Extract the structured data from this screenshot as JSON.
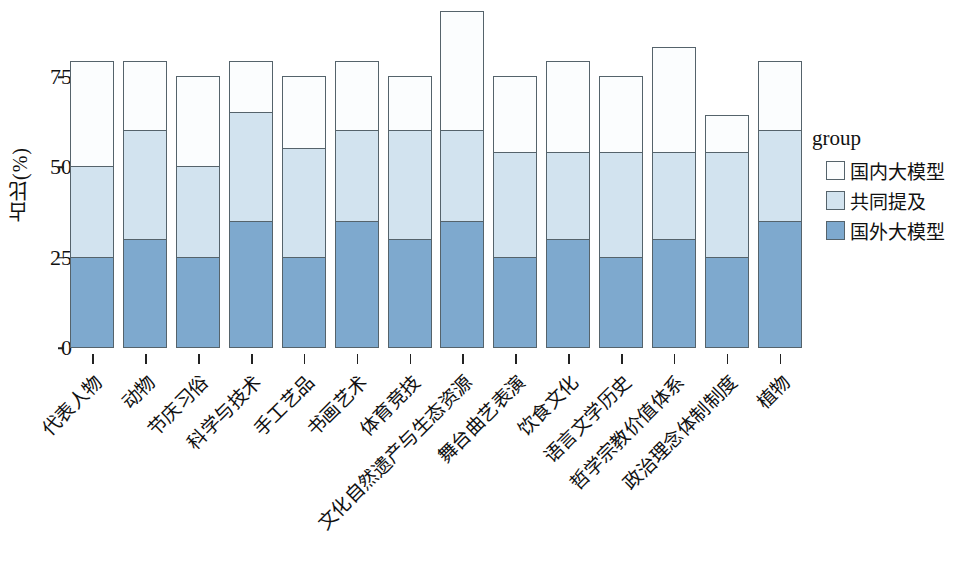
{
  "chart_data": {
    "type": "bar",
    "subtype": "stacked-bar",
    "title": "",
    "xlabel": "",
    "ylabel": "占比(%)",
    "ylim": [
      0,
      100
    ],
    "yticks": [
      0,
      25,
      50,
      75
    ],
    "ytick_labels": [
      "0",
      "25",
      "50",
      "75"
    ],
    "grid": false,
    "legend_position": "right",
    "legend_title": "group",
    "categories": [
      "代表人物",
      "动物",
      "节庆习俗",
      "科学与技术",
      "手工艺品",
      "书画艺术",
      "体育竞技",
      "文化自然遗产与生态资源",
      "舞台曲艺表演",
      "饮食文化",
      "语言文学历史",
      "哲学宗教价值体系",
      "政治理念体制制度",
      "植物"
    ],
    "series": [
      {
        "name": "国外大模型",
        "color": "#7ea9ce",
        "values": [
          25,
          30,
          25,
          35,
          25,
          35,
          30,
          35,
          25,
          30,
          25,
          30,
          25,
          35
        ]
      },
      {
        "name": "共同提及",
        "color": "#d2e3ef",
        "values": [
          25,
          30,
          25,
          30,
          30,
          25,
          30,
          25,
          29,
          24,
          29,
          24,
          29,
          25
        ]
      },
      {
        "name": "国内大模型",
        "color": "#fbfdfe",
        "values": [
          29,
          19,
          25,
          14,
          20,
          19,
          15,
          33,
          21,
          25,
          21,
          29,
          10,
          19
        ]
      }
    ],
    "totals": [
      79,
      79,
      75,
      79,
      75,
      79,
      75,
      93,
      75,
      79,
      75,
      83,
      64,
      79
    ],
    "cumulative_boundaries": [
      [
        25,
        50,
        79
      ],
      [
        30,
        60,
        79
      ],
      [
        25,
        50,
        75
      ],
      [
        35,
        65,
        79
      ],
      [
        25,
        55,
        75
      ],
      [
        35,
        60,
        79
      ],
      [
        30,
        60,
        75
      ],
      [
        35,
        60,
        93
      ],
      [
        25,
        54,
        75
      ],
      [
        30,
        54,
        79
      ],
      [
        25,
        54,
        75
      ],
      [
        30,
        54,
        83
      ],
      [
        25,
        54,
        64
      ],
      [
        35,
        60,
        79
      ]
    ]
  },
  "legend": {
    "title": "group",
    "items": [
      {
        "label": "国内大模型",
        "color": "#fbfdfe"
      },
      {
        "label": "共同提及",
        "color": "#d2e3ef"
      },
      {
        "label": "国外大模型",
        "color": "#7ea9ce"
      }
    ]
  },
  "axes": {
    "y_title": "占比(%)",
    "y_tick_labels": [
      "75",
      "50",
      "25",
      "0"
    ],
    "y_tick_values": [
      75,
      50,
      25,
      0
    ]
  },
  "colors": {
    "domestic_model": "#fbfdfe",
    "both_mentioned": "#d2e3ef",
    "foreign_model": "#7ea9ce",
    "outline": "#55636b",
    "text": "#111111",
    "background": "#ffffff"
  }
}
